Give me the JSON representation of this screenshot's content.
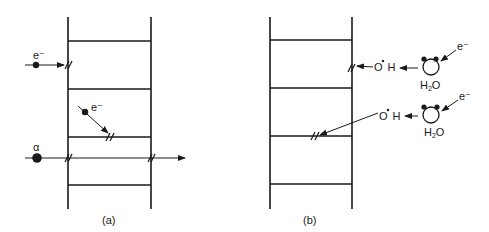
{
  "panels": {
    "a": {
      "caption": "(a)",
      "particles": {
        "electron_direct": "e⁻",
        "electron_oblique": "e⁻",
        "alpha": "α"
      }
    },
    "b": {
      "caption": "(b)",
      "radicals": {
        "top": {
          "o": "O",
          "h": "H"
        },
        "bottom": {
          "o": "O",
          "h": "H"
        }
      },
      "water": {
        "top": {
          "h": "H",
          "sub": "2",
          "o": "O",
          "electron": "e⁻"
        },
        "bottom": {
          "h": "H",
          "sub": "2",
          "o": "O",
          "electron": "e⁻"
        }
      }
    }
  },
  "colors": {
    "ink": "#1a1a1a",
    "background": "#ffffff"
  }
}
